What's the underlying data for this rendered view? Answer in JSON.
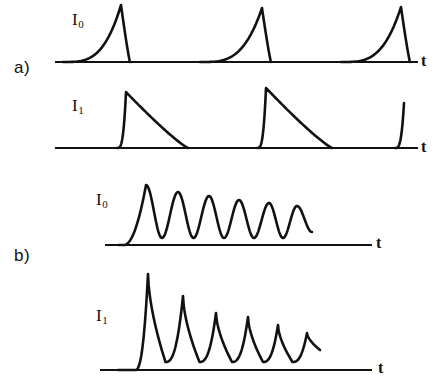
{
  "figure": {
    "background_color": "#ffffff",
    "ink_color": "#111111",
    "width": 443,
    "height": 391,
    "panels": [
      {
        "id": "a",
        "label": "a)",
        "label_position": {
          "x": 14,
          "y": 58
        },
        "traces": [
          {
            "id": "a-i0",
            "label": "I",
            "subscript": "0",
            "label_position": {
              "x": 72,
              "y": 10
            },
            "axis_label": "t",
            "axis_label_position": {
              "x": 421,
              "y": 52
            },
            "baseline_y": 62,
            "baseline_x0": 55,
            "baseline_x1": 418,
            "shape": "slow-rise-fast-fall",
            "peaks": [
              {
                "center": 121,
                "top_y": 5,
                "rise_width": 58,
                "fall_width": 9
              },
              {
                "center": 262,
                "top_y": 8,
                "rise_width": 62,
                "fall_width": 9
              },
              {
                "center": 401,
                "top_y": 7,
                "rise_width": 60,
                "fall_width": 9
              }
            ]
          },
          {
            "id": "a-i1",
            "label": "I",
            "subscript": "1",
            "label_position": {
              "x": 72,
              "y": 96
            },
            "axis_label": "t",
            "axis_label_position": {
              "x": 421,
              "y": 138
            },
            "baseline_y": 148,
            "baseline_x0": 55,
            "baseline_x1": 418,
            "shape": "fast-rise-slow-fall",
            "peaks": [
              {
                "center": 126,
                "top_y": 92,
                "rise_width": 9,
                "fall_width": 62
              },
              {
                "center": 266,
                "top_y": 88,
                "rise_width": 9,
                "fall_width": 66
              },
              {
                "center": 404,
                "top_y": 103,
                "rise_width": 9,
                "fall_width": 0
              }
            ]
          }
        ]
      },
      {
        "id": "b",
        "label": "b)",
        "label_position": {
          "x": 14,
          "y": 246
        },
        "traces": [
          {
            "id": "b-i0",
            "label": "I",
            "subscript": "0",
            "label_position": {
              "x": 96,
              "y": 190
            },
            "axis_label": "t",
            "axis_label_position": {
              "x": 376,
              "y": 234
            },
            "baseline_y": 245,
            "baseline_x0": 105,
            "baseline_x1": 372,
            "shape": "damped-oscillation-broad",
            "oscillation_peaks": 6,
            "peak_centers": [
              146,
              178,
              209,
              239,
              269,
              297
            ],
            "peak_tops": [
              185,
              192,
              196,
              200,
              203,
              206
            ],
            "trough_level": 238,
            "end_x": 312,
            "end_y": 232
          },
          {
            "id": "b-i1",
            "label": "I",
            "subscript": "1",
            "label_position": {
              "x": 96,
              "y": 306
            },
            "axis_label": "t",
            "axis_label_position": {
              "x": 378,
              "y": 359
            },
            "baseline_y": 370,
            "baseline_x0": 100,
            "baseline_x1": 372,
            "shape": "damped-oscillation-sharp",
            "oscillation_peaks": 6,
            "peak_centers": [
              148,
              183,
              216,
              248,
              278,
              307
            ],
            "peak_tops": [
              274,
              296,
              313,
              317,
              325,
              333
            ],
            "trough_level": 362,
            "end_x": 320,
            "end_y": 350
          }
        ]
      }
    ]
  }
}
